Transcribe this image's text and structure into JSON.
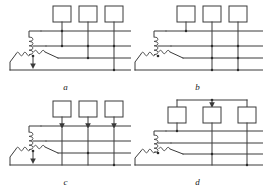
{
  "figure": {
    "type": "electrical-schematic-set",
    "colors": {
      "wire": "#3a3a3a",
      "node": "#2b2b2b",
      "background": "#ffffff",
      "box_fill": "#ffffff",
      "label": "#1a1a1a"
    },
    "panels": [
      {
        "id": "a",
        "label": "a",
        "loads": 3,
        "bus_lines": 3,
        "neutral_arrow": true,
        "load_arrows": false,
        "top_tie_bar": false,
        "top_tie_arrow": false
      },
      {
        "id": "b",
        "label": "b",
        "loads": 3,
        "bus_lines": 3,
        "neutral_arrow": false,
        "load_arrows": false,
        "top_tie_bar": false,
        "top_tie_arrow": false
      },
      {
        "id": "c",
        "label": "c",
        "loads": 3,
        "bus_lines": 3,
        "neutral_arrow": true,
        "load_arrows": true,
        "top_tie_bar": false,
        "top_tie_arrow": false
      },
      {
        "id": "d",
        "label": "d",
        "loads": 3,
        "bus_lines": 3,
        "neutral_arrow": false,
        "load_arrows": false,
        "top_tie_bar": true,
        "top_tie_arrow": true
      }
    ]
  }
}
